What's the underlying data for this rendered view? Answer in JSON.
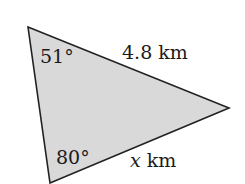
{
  "diagram": {
    "type": "triangle",
    "fill_color": "#d9d9d9",
    "stroke_color": "#222222",
    "vertices": {
      "top": [
        28,
        27
      ],
      "right": [
        229,
        108
      ],
      "bottom": [
        50,
        183
      ]
    },
    "angles": {
      "top": "51°",
      "bottom": "80°"
    },
    "sides": {
      "top_right": {
        "value": "4.8",
        "unit": "km"
      },
      "bottom_right": {
        "variable": "x",
        "unit": "km"
      }
    }
  }
}
